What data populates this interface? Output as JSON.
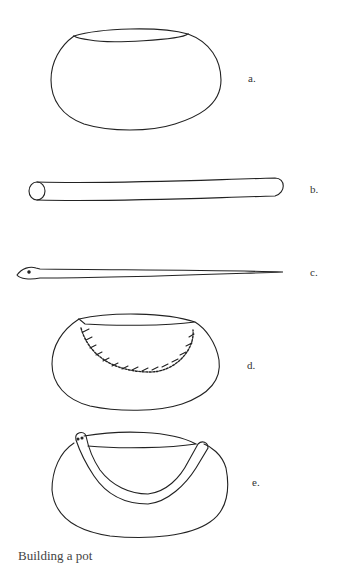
{
  "figure": {
    "panels": [
      {
        "id": "a",
        "label": "a.",
        "description": "Pot form with oval rim opening"
      },
      {
        "id": "b",
        "label": "b.",
        "description": "Rolled clay coil (cylinder)"
      },
      {
        "id": "c",
        "label": "c.",
        "description": "Coil formed as a snake"
      },
      {
        "id": "d",
        "label": "d.",
        "description": "Pot with scored/cross-hatched band"
      },
      {
        "id": "e",
        "label": "e.",
        "description": "Pot with snake coil attached around rim"
      }
    ],
    "caption": "Building a pot"
  }
}
